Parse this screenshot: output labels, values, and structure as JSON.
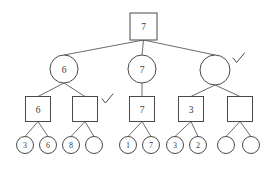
{
  "diagram": {
    "type": "game-tree",
    "background_color": "#ffffff",
    "stroke_color": "#4a4a4a",
    "edge_color": "#5a5a5a",
    "text_color": "#3a3a3a"
  },
  "levels": [
    {
      "name": "root-max-level",
      "shape": "square",
      "nodes": [
        {
          "id": "root",
          "label": "7",
          "cx": 143.5,
          "cy": 26.5,
          "size": 27,
          "checked": false
        }
      ]
    },
    {
      "name": "min-level",
      "shape": "circle",
      "nodes": [
        {
          "id": "min-left",
          "label": "6",
          "cx": 64,
          "cy": 69,
          "r": 14,
          "checked": false
        },
        {
          "id": "min-mid",
          "label": "7",
          "cx": 142,
          "cy": 69,
          "r": 14,
          "checked": false
        },
        {
          "id": "min-right",
          "label": "",
          "cx": 215,
          "cy": 70,
          "r": 15,
          "checked": true
        }
      ]
    },
    {
      "name": "max-level",
      "shape": "square",
      "nodes": [
        {
          "id": "max-1",
          "label": "6",
          "cx": 38,
          "cy": 109,
          "size": 25,
          "checked": false
        },
        {
          "id": "max-2",
          "label": "",
          "cx": 85,
          "cy": 109,
          "size": 25,
          "checked": true
        },
        {
          "id": "max-3",
          "label": "7",
          "cx": 142,
          "cy": 109,
          "size": 25,
          "checked": false
        },
        {
          "id": "max-4",
          "label": "3",
          "cx": 191,
          "cy": 109,
          "size": 25,
          "checked": false
        },
        {
          "id": "max-5",
          "label": "",
          "cx": 240,
          "cy": 109,
          "size": 25,
          "checked": false
        }
      ]
    },
    {
      "name": "leaf-level",
      "shape": "circle",
      "nodes": [
        {
          "id": "leaf-1",
          "label": "3",
          "cx": 25,
          "cy": 145,
          "r": 8.5,
          "checked": false
        },
        {
          "id": "leaf-2",
          "label": "6",
          "cx": 48,
          "cy": 145,
          "r": 8.5,
          "checked": false
        },
        {
          "id": "leaf-3",
          "label": "8",
          "cx": 71,
          "cy": 145,
          "r": 8.5,
          "checked": false
        },
        {
          "id": "leaf-4",
          "label": "",
          "cx": 94,
          "cy": 145,
          "r": 8.5,
          "checked": false
        },
        {
          "id": "leaf-5",
          "label": "1",
          "cx": 128,
          "cy": 145,
          "r": 8.5,
          "checked": false
        },
        {
          "id": "leaf-6",
          "label": "7",
          "cx": 151,
          "cy": 145,
          "r": 8.5,
          "checked": false
        },
        {
          "id": "leaf-7",
          "label": "3",
          "cx": 175,
          "cy": 145,
          "r": 8.5,
          "checked": false
        },
        {
          "id": "leaf-8",
          "label": "2",
          "cx": 198,
          "cy": 145,
          "r": 8.5,
          "checked": false
        },
        {
          "id": "leaf-9",
          "label": "",
          "cx": 226,
          "cy": 145,
          "r": 8.5,
          "checked": false
        },
        {
          "id": "leaf-10",
          "label": "",
          "cx": 251,
          "cy": 145,
          "r": 8.5,
          "checked": false
        }
      ]
    }
  ],
  "edges": [
    {
      "from": "root",
      "to": "min-left"
    },
    {
      "from": "root",
      "to": "min-mid"
    },
    {
      "from": "root",
      "to": "min-right"
    },
    {
      "from": "min-left",
      "to": "max-1"
    },
    {
      "from": "min-left",
      "to": "max-2"
    },
    {
      "from": "min-mid",
      "to": "max-3"
    },
    {
      "from": "min-right",
      "to": "max-4"
    },
    {
      "from": "min-right",
      "to": "max-5"
    },
    {
      "from": "max-1",
      "to": "leaf-1"
    },
    {
      "from": "max-1",
      "to": "leaf-2"
    },
    {
      "from": "max-2",
      "to": "leaf-3"
    },
    {
      "from": "max-2",
      "to": "leaf-4"
    },
    {
      "from": "max-3",
      "to": "leaf-5"
    },
    {
      "from": "max-3",
      "to": "leaf-6"
    },
    {
      "from": "max-4",
      "to": "leaf-7"
    },
    {
      "from": "max-4",
      "to": "leaf-8"
    },
    {
      "from": "max-5",
      "to": "leaf-9"
    },
    {
      "from": "max-5",
      "to": "leaf-10"
    }
  ],
  "checkmarks": [
    {
      "id": "check-min-right",
      "x": 233,
      "y": 53,
      "scale": 1.0
    },
    {
      "id": "check-max-2",
      "x": 102,
      "y": 94,
      "scale": 0.95
    }
  ],
  "labels": {
    "root_value": "7",
    "min_left_value": "6",
    "min_mid_value": "7",
    "min_right_value": "",
    "max_values": [
      "6",
      "",
      "7",
      "3",
      ""
    ],
    "leaf_values": [
      "3",
      "6",
      "8",
      "",
      "1",
      "7",
      "3",
      "2",
      "",
      ""
    ]
  }
}
